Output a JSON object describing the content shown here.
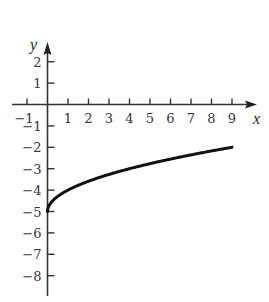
{
  "chart_data": {
    "type": "line",
    "title": "",
    "xlabel": "x",
    "ylabel": "y",
    "xlim": [
      -1.6,
      10.1
    ],
    "ylim": [
      -8.9,
      2.85
    ],
    "grid": false,
    "legend": null,
    "x_ticks": [
      -1,
      1,
      2,
      3,
      4,
      5,
      6,
      7,
      8,
      9
    ],
    "y_ticks": [
      2,
      1,
      -1,
      -2,
      -3,
      -4,
      -5,
      -6,
      -7,
      -8
    ],
    "x_tick_labels": [
      "−1",
      "1",
      "2",
      "3",
      "4",
      "5",
      "6",
      "7",
      "8",
      "9"
    ],
    "y_tick_labels": [
      "2",
      "1",
      "−1",
      "−2",
      "−3",
      "−4",
      "−5",
      "−6",
      "−7",
      "−8"
    ],
    "series": [
      {
        "name": "y = sqrt(x) - 5",
        "x": [
          0,
          0.25,
          0.5,
          1,
          2,
          3,
          4,
          5,
          6,
          7,
          8,
          9
        ],
        "y": [
          -5,
          -4.5,
          -4.29,
          -4,
          -3.59,
          -3.27,
          -3,
          -2.76,
          -2.55,
          -2.35,
          -2.17,
          -2
        ]
      }
    ],
    "color": "#111111"
  }
}
